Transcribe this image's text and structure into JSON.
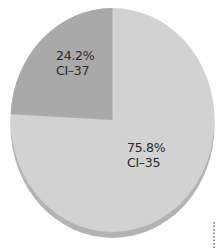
{
  "chart_data": {
    "type": "pie",
    "title": "",
    "style": "3d-tilted",
    "slices": [
      {
        "name": "CI-37",
        "percent_label": "24.2%",
        "category_label": "CI–37",
        "value": 24.2,
        "color": "#a9a9a9"
      },
      {
        "name": "CI-35",
        "percent_label": "75.8%",
        "category_label": "CI–35",
        "value": 75.8,
        "color": "#d2d2d2"
      }
    ],
    "rim_color": "#b3b3b3",
    "legend": null,
    "start_angle_deg": -90,
    "direction": "counterclockwise-from-top for small slice"
  }
}
